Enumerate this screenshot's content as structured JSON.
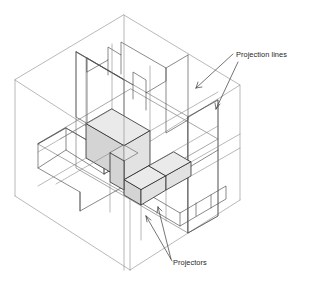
{
  "diagram": {
    "background_color": "#ffffff",
    "line_color": "#2b2b2b",
    "box_line_color": "#8a8a8a",
    "shade_color_top": "#eaeaea",
    "shade_color_left": "#d4d4d4",
    "shade_color_right": "#e2e2e2"
  },
  "annotations": [
    {
      "id": "projection-lines",
      "label": "Projection lines",
      "text_x": 236,
      "text_y": 57,
      "arrow_count": 2
    },
    {
      "id": "projectors",
      "label": "Projectors",
      "text_x": 173,
      "text_y": 265,
      "arrow_count": 2
    }
  ],
  "geometry": {
    "glass_box": {
      "top_vertex": [
        124,
        15
      ],
      "left_vertex": [
        15,
        80
      ],
      "right_vertex": [
        240,
        85
      ],
      "bottom_vertex": [
        130,
        270
      ],
      "front_lower_left": [
        15,
        196
      ],
      "front_lower_right": [
        240,
        200
      ],
      "center_lower": [
        124,
        131
      ]
    },
    "object": {
      "description": "stepped notched block at center of glass box",
      "faces": 3
    },
    "projected_views": {
      "top_plane": "back-upper plane outline",
      "left_plane": "left profile extruded view",
      "bottom_plane": "horizontal floor plan view",
      "right_plane": "right side vertical plane"
    }
  }
}
